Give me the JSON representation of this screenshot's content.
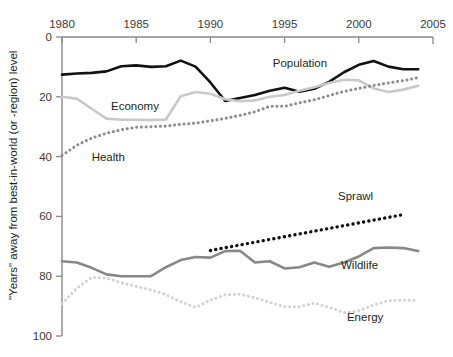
{
  "chart_data": {
    "type": "line",
    "title": "",
    "xlabel": "",
    "ylabel": "\"Years\" away from best-in-world (or -region) level",
    "xlim": [
      1980,
      2005
    ],
    "ylim": [
      0,
      100
    ],
    "y_inverted": true,
    "grid": false,
    "legend_position": "inline-labels",
    "xticks": [
      "1980",
      "1985",
      "1990",
      "1995",
      "2000",
      "2005"
    ],
    "xtick_values": [
      1980,
      1985,
      1990,
      1995,
      2000,
      2005
    ],
    "yticks": [
      "0",
      "20",
      "40",
      "60",
      "80",
      "100"
    ],
    "ytick_values": [
      0,
      20,
      40,
      60,
      80,
      100
    ],
    "series": [
      {
        "name": "Population",
        "color": "#111111",
        "style": "solid",
        "width": 2.6,
        "label_x": 1994.2,
        "label_y": 10.0,
        "x": [
          1980,
          1981,
          1982,
          1983,
          1984,
          1985,
          1986,
          1987,
          1988,
          1989,
          1990,
          1991,
          1992,
          1993,
          1994,
          1995,
          1996,
          1997,
          1998,
          1999,
          2000,
          2001,
          2002,
          2003,
          2004
        ],
        "y": [
          12.6,
          12.2,
          12.0,
          11.5,
          9.8,
          9.5,
          10.0,
          9.8,
          7.9,
          9.9,
          15.2,
          21.4,
          20.4,
          19.4,
          18.0,
          17.0,
          18.3,
          17.3,
          15.0,
          11.8,
          9.3,
          8.0,
          9.9,
          10.8,
          10.8
        ]
      },
      {
        "name": "Economy",
        "color": "#c9c9c9",
        "style": "solid",
        "width": 2.6,
        "label_x": 1983.3,
        "label_y": 24.5,
        "x": [
          1980,
          1981,
          1982,
          1983,
          1984,
          1985,
          1986,
          1987,
          1988,
          1989,
          1990,
          1991,
          1992,
          1993,
          1994,
          1995,
          1996,
          1997,
          1998,
          1999,
          2000,
          2001,
          2002,
          2003,
          2004
        ],
        "y": [
          20.0,
          20.6,
          24.0,
          27.3,
          27.7,
          27.7,
          27.8,
          27.6,
          19.8,
          18.4,
          19.0,
          20.8,
          21.5,
          21.2,
          20.0,
          19.4,
          18.0,
          16.8,
          15.4,
          14.3,
          14.5,
          17.2,
          18.4,
          17.6,
          16.3
        ]
      },
      {
        "name": "Health",
        "color": "#8c8c8c",
        "style": "dotted",
        "width": 3.0,
        "label_x": 1982.0,
        "label_y": 41.5,
        "x": [
          1980,
          1981,
          1982,
          1983,
          1984,
          1985,
          1986,
          1987,
          1988,
          1989,
          1990,
          1991,
          1992,
          1993,
          1994,
          1995,
          1996,
          1997,
          1998,
          1999,
          2000,
          2001,
          2002,
          2003,
          2004
        ],
        "y": [
          39.6,
          36.2,
          33.8,
          32.2,
          31.0,
          30.2,
          30.0,
          29.8,
          29.2,
          28.8,
          28.0,
          27.2,
          26.2,
          25.0,
          23.2,
          23.2,
          22.0,
          21.0,
          19.6,
          18.2,
          17.2,
          16.2,
          15.4,
          14.6,
          13.6
        ]
      },
      {
        "name": "Sprawl",
        "color": "#111111",
        "style": "dotted",
        "width": 3.4,
        "label_x": 1998.6,
        "label_y": 54.5,
        "x": [
          1990,
          2003
        ],
        "y": [
          71.4,
          59.4
        ]
      },
      {
        "name": "Wildlife",
        "color": "#888888",
        "style": "solid",
        "width": 2.6,
        "label_x": 1998.8,
        "label_y": 77.5,
        "x": [
          1980,
          1981,
          1982,
          1983,
          1984,
          1985,
          1986,
          1987,
          1988,
          1989,
          1990,
          1991,
          1992,
          1993,
          1994,
          1995,
          1996,
          1997,
          1998,
          1999,
          2000,
          2001,
          2002,
          2003,
          2004
        ],
        "y": [
          75.0,
          75.4,
          77.2,
          79.4,
          80.0,
          80.0,
          80.0,
          77.0,
          74.6,
          73.6,
          73.8,
          71.6,
          71.5,
          75.4,
          75.0,
          77.4,
          77.0,
          75.4,
          76.8,
          75.4,
          73.4,
          70.6,
          70.4,
          70.6,
          71.6
        ]
      },
      {
        "name": "Energy",
        "color": "#d2d2d2",
        "style": "dotted",
        "width": 3.0,
        "label_x": 1999.2,
        "label_y": 95.0,
        "x": [
          1980,
          1981,
          1982,
          1983,
          1984,
          1985,
          1986,
          1987,
          1988,
          1989,
          1990,
          1991,
          1992,
          1993,
          1994,
          1995,
          1996,
          1997,
          1998,
          1999,
          2000,
          2001,
          2002,
          2003,
          2004
        ],
        "y": [
          89.2,
          84.0,
          80.4,
          80.6,
          82.2,
          83.4,
          84.6,
          86.2,
          88.6,
          90.4,
          88.0,
          86.2,
          86.0,
          87.2,
          88.8,
          90.2,
          90.2,
          89.0,
          90.4,
          92.2,
          91.6,
          89.6,
          88.2,
          88.0,
          88.2
        ]
      }
    ]
  },
  "axes": {
    "y_axis_title": "\"Years\" away from best-in-world (or -region) level"
  }
}
